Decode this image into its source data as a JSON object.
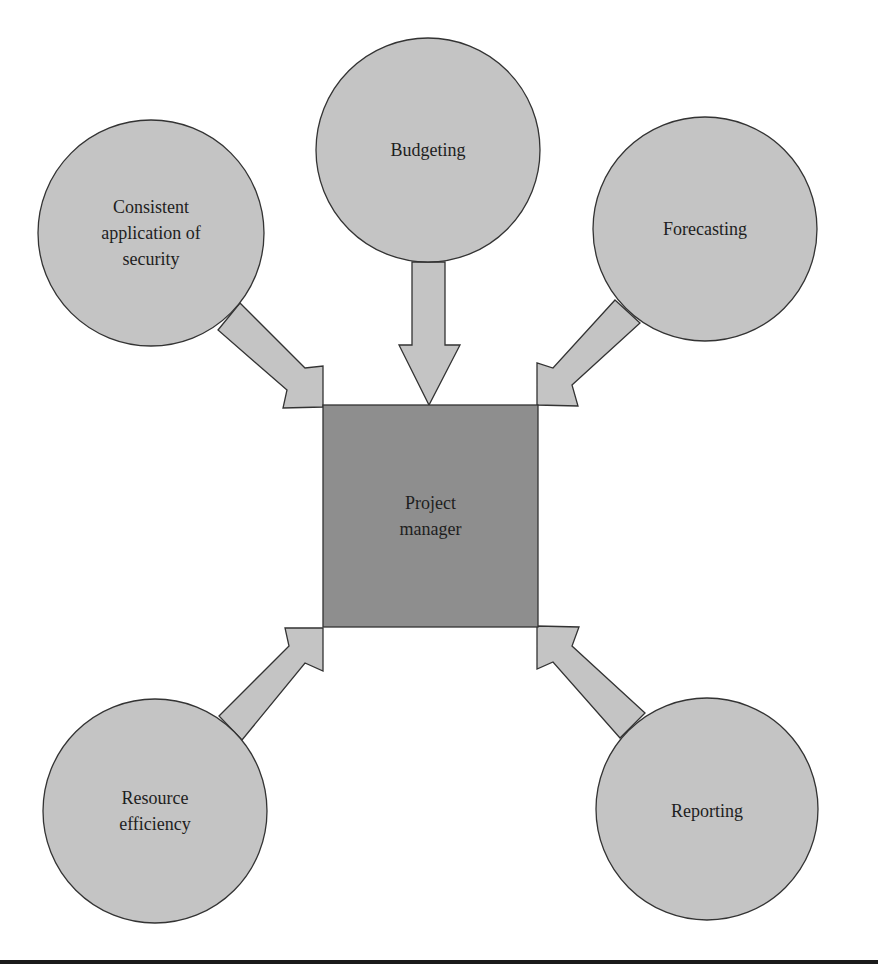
{
  "diagram": {
    "colors": {
      "circle_fill": "#c4c4c4",
      "arrow_fill": "#c4c4c4",
      "center_fill": "#8e8e8e",
      "stroke": "#333333",
      "text": "#1e1e1e",
      "rule": "#1a1a1a"
    },
    "center": {
      "label": "Project\nmanager"
    },
    "nodes": [
      {
        "id": "security",
        "label": "Consistent\napplication of\nsecurity"
      },
      {
        "id": "budgeting",
        "label": "Budgeting"
      },
      {
        "id": "forecasting",
        "label": "Forecasting"
      },
      {
        "id": "resource-efficiency",
        "label": "Resource\nefficiency"
      },
      {
        "id": "reporting",
        "label": "Reporting"
      }
    ],
    "edges": [
      {
        "from": "security",
        "to": "center"
      },
      {
        "from": "budgeting",
        "to": "center"
      },
      {
        "from": "forecasting",
        "to": "center"
      },
      {
        "from": "resource-efficiency",
        "to": "center"
      },
      {
        "from": "reporting",
        "to": "center"
      }
    ]
  }
}
